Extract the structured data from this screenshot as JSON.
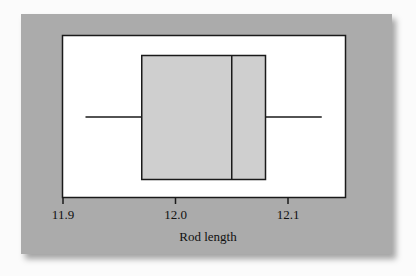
{
  "chart_data": {
    "type": "boxplot",
    "orientation": "horizontal",
    "title": "",
    "xlabel": "Rod length",
    "ylabel": "",
    "xlim": [
      11.9,
      12.15
    ],
    "xticks": [
      11.9,
      12.0,
      12.1
    ],
    "xtick_labels": [
      "11.9",
      "12.0",
      "12.1"
    ],
    "grid": false,
    "legend": null,
    "series": [
      {
        "name": "Rod length",
        "min": 11.92,
        "q1": 11.97,
        "median": 12.05,
        "q3": 12.08,
        "max": 12.13
      }
    ]
  },
  "colors": {
    "page_background": "#fbfbfb",
    "panel_background": "#ababab",
    "plot_background": "#ffffff",
    "box_fill": "#cfcfcf",
    "line": "#1a1a1a"
  },
  "axis": {
    "ticks": [
      {
        "label": "11.9"
      },
      {
        "label": "12.0"
      },
      {
        "label": "12.1"
      }
    ],
    "title": "Rod length"
  }
}
